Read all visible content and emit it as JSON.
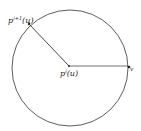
{
  "diagram": {
    "circle": {
      "cx": 70,
      "cy": 68,
      "r": 58,
      "stroke": "#333333"
    },
    "center_point": {
      "x": 69,
      "y": 66
    },
    "boundary_point_upper": {
      "x": 29,
      "y": 24
    },
    "boundary_point_right": {
      "x": 128,
      "y": 66
    },
    "labels": {
      "upper": {
        "base": "p",
        "sup": "i+1",
        "arg": "(u)"
      },
      "center": {
        "base": "p",
        "sup": "i",
        "arg": "(u)"
      },
      "right": {
        "base": "q",
        "sub": "v"
      }
    }
  }
}
